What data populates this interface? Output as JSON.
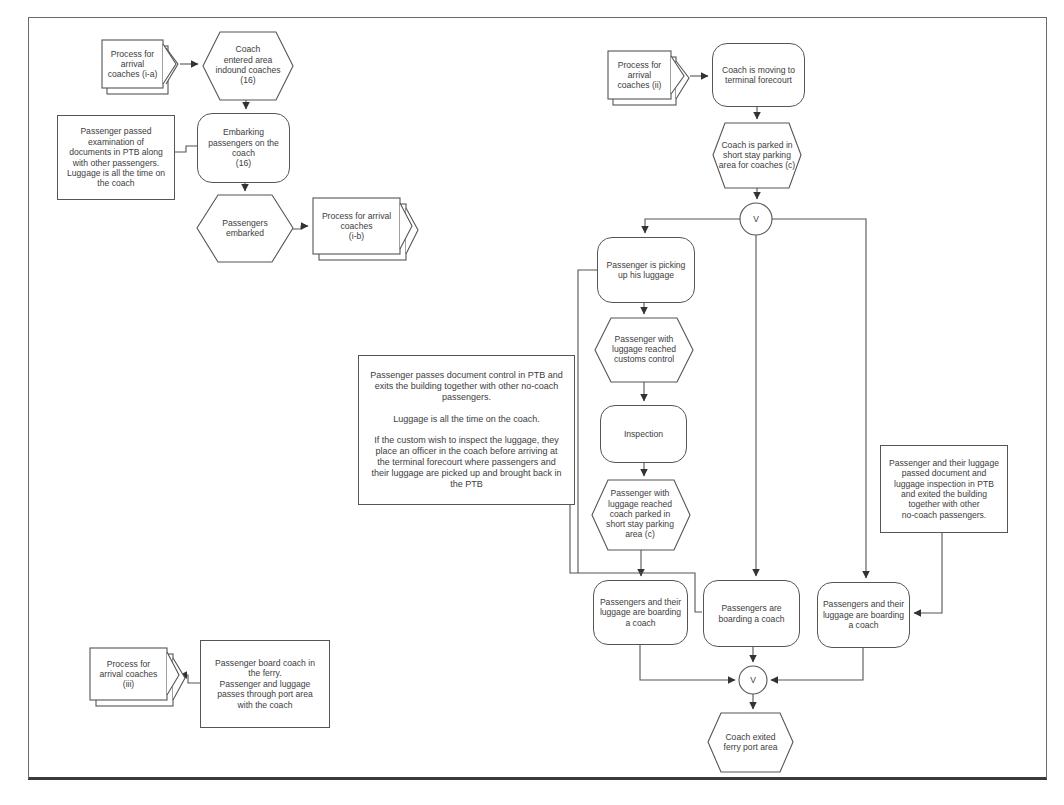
{
  "meta": {
    "diagram_type": "flowchart",
    "stroke_color": "#555555",
    "text_color": "#3d3d3d",
    "background_color": "#ffffff"
  },
  "junctions": {
    "top": "V",
    "bottom": "V"
  },
  "nodes": {
    "offpage_ia": "Process for\narrival\ncoaches (i-a)",
    "hex_entered": "Coach\nentered area\nindound coaches\n(16)",
    "note_exam": "Passenger passed\nexamination of\ndocuments in PTB along\nwith other passengers.\nLuggage is all the time on\nthe coach",
    "rounded_embarking": "Embarking\npassengers on the\ncoach\n(16)",
    "hex_embarked": "Passengers\nembarked",
    "offpage_ib": "Process for arrival\ncoaches\n(i-b)",
    "offpage_ii": "Process for\narrival\ncoaches (ii)",
    "rounded_moving": "Coach is moving to\nterminal forecourt",
    "hex_parked_c": "Coach is parked in\nshort stay parking\narea for coaches (c)",
    "rounded_picking": "Passenger is picking\nup his luggage",
    "hex_customs": "Passenger with\nluggage reached\ncustoms control",
    "rounded_inspection": "Inspection",
    "hex_parked_area": "Passenger with\nluggage reached\ncoach parked in\nshort stay parking\narea (c)",
    "note_control": "Passenger passes document control in PTB and\nexits the building together with other no-coach\npassengers.\n\nLuggage is all the time on the coach.\n\nIf the custom wish to inspect the luggage, they\nplace an officer in the coach before arriving at\nthe terminal forecourt where passengers and\ntheir luggage are picked up and brought back in\nthe PTB",
    "note_right": "Passenger and their luggage\npassed document and\nluggage inspection in PTB\nand exited the building\ntogether with other\nno-coach passengers.",
    "boarding_left": "Passengers and their\nluggage are boarding\na coach",
    "boarding_mid": "Passengers are\nboarding a coach",
    "boarding_right": "Passengers and their\nluggage are boarding\na coach",
    "hex_exited": "Coach exited\nferry port area",
    "offpage_iii": "Process for\narrival coaches\n(iii)",
    "rect_ferry": "Passenger board coach in\nthe ferry.\nPassenger and luggage\npasses through port area\nwith the coach"
  }
}
